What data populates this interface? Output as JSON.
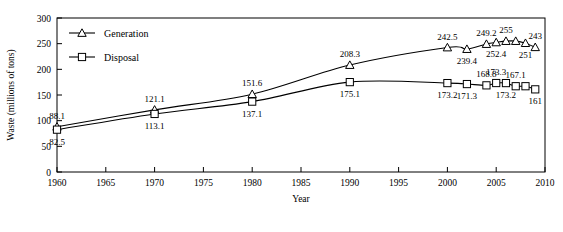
{
  "chart_data": {
    "type": "line",
    "title": "",
    "xlabel": "Year",
    "ylabel": "Waste (millions of tons)",
    "xlim": [
      1960,
      2010
    ],
    "ylim": [
      0,
      300
    ],
    "xticks": [
      1960,
      1965,
      1970,
      1975,
      1980,
      1985,
      1990,
      1995,
      2000,
      2005,
      2010
    ],
    "yticks": [
      0,
      50,
      100,
      150,
      200,
      250,
      300
    ],
    "grid": false,
    "legend_position": "top-left",
    "series": [
      {
        "name": "Generation",
        "marker": "triangle",
        "x": [
          1960,
          1970,
          1980,
          1990,
          2000,
          2002,
          2004,
          2005,
          2006,
          2007,
          2008,
          2009
        ],
        "values": [
          88.1,
          121.1,
          151.6,
          208.3,
          242.5,
          239.4,
          249.2,
          252.4,
          255,
          255,
          251,
          243
        ],
        "labels": [
          {
            "year": 1960,
            "value": 88.1,
            "text": "88.1",
            "pos": "above"
          },
          {
            "year": 1970,
            "value": 121.1,
            "text": "121.1",
            "pos": "above"
          },
          {
            "year": 1980,
            "value": 151.6,
            "text": "151.6",
            "pos": "above"
          },
          {
            "year": 1990,
            "value": 208.3,
            "text": "208.3",
            "pos": "above"
          },
          {
            "year": 2000,
            "value": 242.5,
            "text": "242.5",
            "pos": "above"
          },
          {
            "year": 2002,
            "value": 239.4,
            "text": "239.4",
            "pos": "below"
          },
          {
            "year": 2004,
            "value": 249.2,
            "text": "249.2",
            "pos": "above"
          },
          {
            "year": 2005,
            "value": 252.4,
            "text": "252.4",
            "pos": "below"
          },
          {
            "year": 2006,
            "value": 255,
            "text": "255",
            "pos": "above"
          },
          {
            "year": 2008,
            "value": 251,
            "text": "251",
            "pos": "below"
          },
          {
            "year": 2009,
            "value": 243,
            "text": "243",
            "pos": "above"
          }
        ]
      },
      {
        "name": "Disposal",
        "marker": "square",
        "x": [
          1960,
          1970,
          1980,
          1990,
          2000,
          2002,
          2004,
          2005,
          2006,
          2007,
          2008,
          2009
        ],
        "values": [
          82.5,
          113.1,
          137.1,
          175.1,
          173.2,
          171.3,
          168.8,
          173.3,
          173.2,
          167.1,
          167.1,
          161
        ],
        "labels": [
          {
            "year": 1960,
            "value": 82.5,
            "text": "82.5",
            "pos": "below"
          },
          {
            "year": 1970,
            "value": 113.1,
            "text": "113.1",
            "pos": "below"
          },
          {
            "year": 1980,
            "value": 137.1,
            "text": "137.1",
            "pos": "below"
          },
          {
            "year": 1990,
            "value": 175.1,
            "text": "175.1",
            "pos": "below"
          },
          {
            "year": 2000,
            "value": 173.2,
            "text": "173.2",
            "pos": "below"
          },
          {
            "year": 2002,
            "value": 171.3,
            "text": "171.3",
            "pos": "below"
          },
          {
            "year": 2004,
            "value": 168.8,
            "text": "168.8",
            "pos": "above"
          },
          {
            "year": 2005,
            "value": 173.3,
            "text": "173.3",
            "pos": "above"
          },
          {
            "year": 2006,
            "value": 173.2,
            "text": "173.2",
            "pos": "below"
          },
          {
            "year": 2007,
            "value": 167.1,
            "text": "167.1",
            "pos": "above"
          },
          {
            "year": 2009,
            "value": 161,
            "text": "161",
            "pos": "below"
          }
        ]
      }
    ]
  },
  "legend": {
    "items": [
      {
        "label": "Generation",
        "marker": "triangle"
      },
      {
        "label": "Disposal",
        "marker": "square"
      }
    ]
  },
  "colors": {
    "axis": "#000000",
    "line": "#000000",
    "marker_fill": "#ffffff",
    "background": "#ffffff"
  }
}
